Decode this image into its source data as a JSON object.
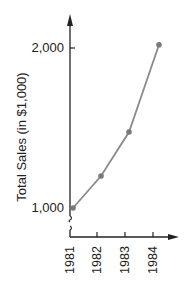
{
  "chart_data": {
    "type": "line",
    "title": "",
    "xlabel": "",
    "ylabel": "Total Sales (in $1,000)",
    "categories": [
      "1981",
      "1982",
      "1983",
      "1984"
    ],
    "series": [
      {
        "name": "Total Sales",
        "values": [
          1000,
          1200,
          1475,
          2020
        ]
      }
    ],
    "yticks": [
      "1,000",
      "2,000"
    ],
    "ylim": [
      1000,
      2000
    ],
    "y_axis_break": true,
    "grid": false,
    "legend": "none",
    "colors": {
      "line": "#8a8a8a",
      "marker": "#7a7a7a",
      "axis": "#222222"
    }
  }
}
